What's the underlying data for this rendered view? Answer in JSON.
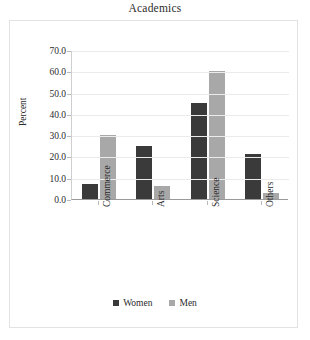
{
  "chart_data": {
    "type": "bar",
    "title": "Academics",
    "xlabel": "",
    "ylabel": "Percent",
    "categories": [
      "Commerce",
      "Arts",
      "Science",
      "Others"
    ],
    "series": [
      {
        "name": "Women",
        "color": "#3a3a3a",
        "values": [
          7,
          25,
          45,
          21
        ]
      },
      {
        "name": "Men",
        "color": "#a8a8a8",
        "values": [
          30,
          6,
          60,
          3
        ]
      }
    ],
    "ylim": [
      0,
      70
    ],
    "ytick_labels": [
      "70.0",
      "60.0",
      "50.0",
      "40.0",
      "30.0",
      "20.0",
      "10.0",
      "0.0"
    ],
    "ytick_values": [
      70,
      60,
      50,
      40,
      30,
      20,
      10,
      0
    ],
    "grid": true,
    "legend_position": "bottom",
    "legend_entries": [
      "Women",
      "Men"
    ]
  }
}
